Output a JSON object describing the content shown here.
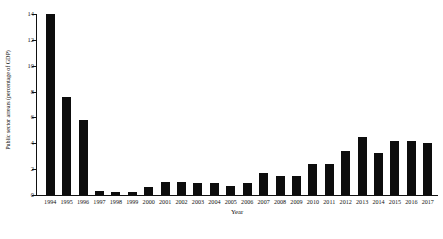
{
  "chart_data": {
    "type": "bar",
    "title": "",
    "xlabel": "Year",
    "ylabel": "Public sector arrears (percentage of GDP)",
    "categories": [
      "1994",
      "1995",
      "1996",
      "1997",
      "1998",
      "1999",
      "2000",
      "2001",
      "2002",
      "2003",
      "2004",
      "2005",
      "2006",
      "2007",
      "2008",
      "2009",
      "2010",
      "2011",
      "2012",
      "2013",
      "2014",
      "2015",
      "2016",
      "2017"
    ],
    "values": [
      14.0,
      7.6,
      5.8,
      0.3,
      0.2,
      0.2,
      0.6,
      1.0,
      1.0,
      0.9,
      0.9,
      0.7,
      0.9,
      1.7,
      1.5,
      1.5,
      2.4,
      2.4,
      3.4,
      4.5,
      3.25,
      4.2,
      4.15,
      4.0
    ],
    "ylim": [
      0,
      14
    ],
    "yticks": [
      0,
      2,
      4,
      6,
      8,
      10,
      12,
      14
    ],
    "ytick_labels": [
      "0",
      "2",
      "4",
      "6",
      "8",
      "10",
      "12",
      "14"
    ],
    "grid": false,
    "legend": false,
    "bar_color": "#0d0d0d",
    "background_color": "#ffffff",
    "axis_color": "#111111"
  }
}
